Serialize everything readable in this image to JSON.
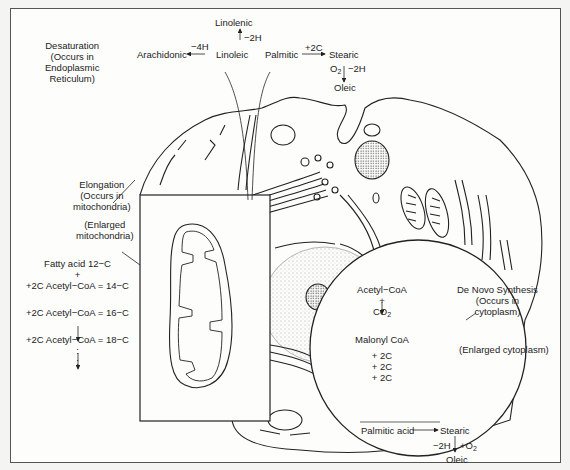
{
  "diagram": {
    "desaturation": {
      "label": "Desaturation",
      "location_lines": [
        "(Occurs in",
        "Endoplasmic",
        "Reticulum)"
      ],
      "linolenic": "Linolenic",
      "minus2h": "−2H",
      "arachidonic": "Arachidonic",
      "minus4h": "−4H",
      "linoleic": "Linoleic",
      "palmitic": "Palmitic",
      "plus2c": "+2C",
      "stearic": "Stearic",
      "o2": "O",
      "o2_sub": "2",
      "minus2h_b": "−2H",
      "oleic": "Oleic"
    },
    "elongation": {
      "label": "Elongation",
      "location_lines": [
        "(Occurs in",
        "mitochondria)"
      ],
      "enlarged_lines": [
        "(Enlarged",
        "mitochondria)"
      ],
      "steps": [
        "Fatty acid 12−C",
        "+",
        "+2C Acetyl−CoA = 14−C",
        "+2C Acetyl−CoA = 16−C",
        "+2C Acetyl−CoA = 18−C"
      ],
      "ellipsis": ":"
    },
    "de_novo": {
      "label": "De Novo Synthesis",
      "location_lines": [
        "(Occurs in",
        "cytoplasm)"
      ],
      "enlarged": "(Enlarged cytoplasm)",
      "acetyl_coa": "Acetyl−CoA",
      "plus": "+",
      "co2": "CO",
      "co2_sub": "2",
      "malonyl": "Malonyl CoA",
      "additions": [
        "+ 2C",
        "+ 2C",
        "+ 2C"
      ],
      "palmitic_acid": "Palmitic acid",
      "stearic": "Stearic",
      "minus2h": "−2H",
      "plus_o2": "+O",
      "plus_o2_sub": "2",
      "oleic": "Oleic"
    }
  }
}
